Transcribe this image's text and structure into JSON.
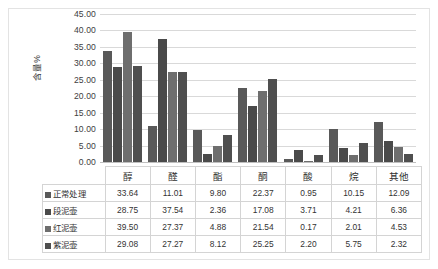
{
  "chart_data": {
    "type": "bar",
    "title": "",
    "xlabel": "",
    "ylabel": "含量%",
    "ylim": [
      0,
      45
    ],
    "ytick_step": 5,
    "ytick_labels": [
      "45.00",
      "40.00",
      "35.00",
      "30.00",
      "25.00",
      "20.00",
      "15.00",
      "10.00",
      "5.00",
      "0.00"
    ],
    "grid": true,
    "legend_position": "data-table",
    "categories": [
      "醇",
      "醛",
      "酯",
      "酮",
      "酸",
      "烷",
      "其他"
    ],
    "series": [
      {
        "name": "正常处理",
        "color": "#595959",
        "values": [
          33.64,
          11.01,
          9.8,
          22.37,
          0.95,
          10.15,
          12.09
        ]
      },
      {
        "name": "段泥壶",
        "color": "#4a4a4a",
        "values": [
          28.75,
          37.54,
          2.36,
          17.08,
          3.71,
          4.21,
          6.36
        ]
      },
      {
        "name": "红泥壶",
        "color": "#6e6e6e",
        "values": [
          39.5,
          27.37,
          4.88,
          21.54,
          0.17,
          2.01,
          4.53
        ]
      },
      {
        "name": "紫泥壶",
        "color": "#4f4f4f",
        "values": [
          29.08,
          27.27,
          8.12,
          25.25,
          2.2,
          5.75,
          2.32
        ]
      }
    ],
    "value_labels": [
      [
        "33.64",
        "11.01",
        "9.80",
        "22.37",
        "0.95",
        "10.15",
        "12.09"
      ],
      [
        "28.75",
        "37.54",
        "2.36",
        "17.08",
        "3.71",
        "4.21",
        "6.36"
      ],
      [
        "39.50",
        "27.37",
        "4.88",
        "21.54",
        "0.17",
        "2.01",
        "4.53"
      ],
      [
        "29.08",
        "27.27",
        "8.12",
        "25.25",
        "2.20",
        "5.75",
        "2.32"
      ]
    ]
  },
  "colors": {
    "grid": "#d9d9d9",
    "axis": "#bfbfbf",
    "border": "#e3e3e3",
    "text": "#333333",
    "background": "#ffffff"
  }
}
